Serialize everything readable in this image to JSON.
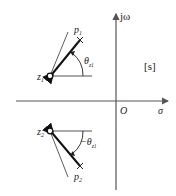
{
  "diagram": {
    "plane_label": "[s]",
    "axes": {
      "real_label": "σ",
      "imag_label": "jω",
      "origin_label": "O"
    },
    "upper": {
      "zero": {
        "base": "z",
        "sub": "1"
      },
      "pole": {
        "base": "p",
        "sub": "1"
      },
      "angle": {
        "prefix": "",
        "base": "θ",
        "sub": "z1"
      }
    },
    "lower": {
      "zero": {
        "base": "z",
        "sub": "2"
      },
      "pole": {
        "base": "p",
        "sub": "2"
      },
      "angle": {
        "prefix": "−",
        "base": "θ",
        "sub": "z1"
      }
    },
    "colors": {
      "axis": "#555555",
      "vector": "#111111",
      "thin_line": "#333333"
    }
  }
}
